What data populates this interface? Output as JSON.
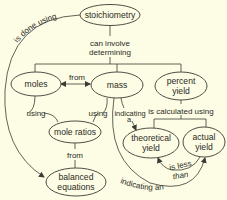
{
  "diagram": {
    "type": "concept-map",
    "background": "#fdfde6",
    "stroke_color": "#3a3a32",
    "nodes": {
      "stoichiometry": "stoichiometry",
      "moles": "moles",
      "mass": "mass",
      "percent_yield": [
        "percent",
        "yield"
      ],
      "mole_ratios": "mole ratios",
      "balanced_equations": [
        "balanced",
        "equations"
      ],
      "theoretical_yield": [
        "theoretical",
        "yield"
      ],
      "actual_yield": [
        "actual",
        "yield"
      ]
    },
    "links": {
      "is_done_using": "is done using",
      "can_involve": "can involve",
      "determining": "determining",
      "from_moles_mass": "from",
      "using_left": "using",
      "using_right": "using",
      "indicating": "indicating",
      "indicating_a": "a",
      "is_calculated_using": "is calculated using",
      "from_ratios": "from",
      "is_less": "is less",
      "than": "than",
      "indicating_an": "indicating an"
    },
    "edges": [
      {
        "from": "stoichiometry",
        "to": "balanced equations",
        "label": "is done using"
      },
      {
        "from": "stoichiometry",
        "to": [
          "moles",
          "mass",
          "percent yield"
        ],
        "label": "can involve determining"
      },
      {
        "from": "moles",
        "to": "mass",
        "label": "from",
        "bidirectional": true
      },
      {
        "from": [
          "moles",
          "mass"
        ],
        "to": "mole ratios",
        "label": "using"
      },
      {
        "from": "mass",
        "to": "theoretical yield",
        "label": "indicating a"
      },
      {
        "from": "percent yield",
        "to": [
          "theoretical yield",
          "actual yield"
        ],
        "label": "is calculated using"
      },
      {
        "from": "mole ratios",
        "to": "balanced equations",
        "label": "from"
      },
      {
        "from": "actual yield",
        "to": "theoretical yield",
        "label": "is less than"
      },
      {
        "from": "mass",
        "to": "actual yield",
        "label": "indicating an"
      }
    ]
  }
}
